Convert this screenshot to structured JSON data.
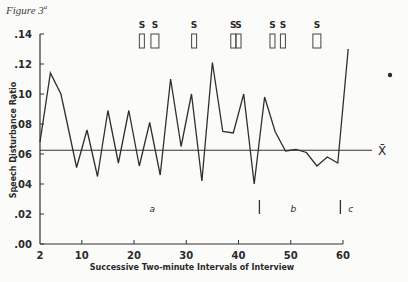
{
  "figure": {
    "title": "Figure 3",
    "superscript": "a"
  },
  "chart_data": {
    "type": "line",
    "title": "Figure 3",
    "xlabel": "Successive Two-minute Intervals of Interview",
    "ylabel": "Speech Disturbance Ratio",
    "xlim": [
      2,
      60
    ],
    "ylim": [
      0,
      0.14
    ],
    "x_ticks": [
      2,
      10,
      20,
      30,
      40,
      50,
      60
    ],
    "x_tick_labels": [
      "2",
      "10",
      "20",
      "30",
      "40",
      "50",
      "60"
    ],
    "y_ticks": [
      0,
      0.02,
      0.04,
      0.06,
      0.08,
      0.1,
      0.12,
      0.14
    ],
    "y_tick_labels": [
      ".00",
      ".02",
      ".04",
      ".06",
      ".08",
      ".10",
      ".12",
      ".14"
    ],
    "grid": false,
    "series": [
      {
        "name": "Speech Disturbance Ratio",
        "x": [
          2,
          4,
          6,
          7,
          9,
          11,
          13,
          15,
          17,
          19,
          21,
          23,
          25,
          27,
          29,
          31,
          33,
          35,
          37,
          39,
          41,
          43,
          45,
          47,
          49,
          51,
          53,
          55,
          57,
          59,
          61
        ],
        "values": [
          0.068,
          0.114,
          0.1,
          0.084,
          0.051,
          0.076,
          0.045,
          0.089,
          0.054,
          0.089,
          0.052,
          0.081,
          0.046,
          0.11,
          0.065,
          0.1,
          0.042,
          0.121,
          0.075,
          0.074,
          0.1,
          0.04,
          0.098,
          0.075,
          0.062,
          0.063,
          0.061,
          0.052,
          0.058,
          0.054,
          0.13
        ]
      }
    ],
    "mean_line": {
      "label": "X̄",
      "value": 0.0625
    },
    "s_markers": [
      {
        "label": "S",
        "x": 21.5
      },
      {
        "label": "S",
        "x": 24
      },
      {
        "label": "S",
        "x": 31.5
      },
      {
        "label": "S",
        "x": 39
      },
      {
        "label": "S",
        "x": 40
      },
      {
        "label": "S",
        "x": 46.5
      },
      {
        "label": "S",
        "x": 48.5
      },
      {
        "label": "S",
        "x": 55
      }
    ],
    "segments": [
      {
        "label": "a",
        "x": 23.5
      },
      {
        "label": "b",
        "x": 50.5
      },
      {
        "label": "c",
        "x": 61.5
      }
    ],
    "segment_dividers": [
      44,
      59.5
    ],
    "annotations": [
      "•"
    ]
  }
}
